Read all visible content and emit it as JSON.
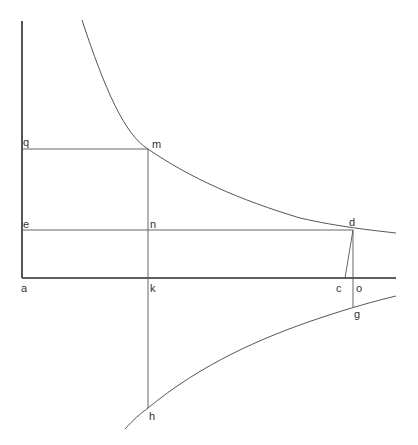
{
  "diagram": {
    "colors": {
      "axis": "#2a2a2a",
      "line": "#555555",
      "label": "#333333",
      "background": "#ffffff"
    },
    "axes": {
      "vertical": {
        "x1": 22,
        "y1": 21,
        "x2": 22,
        "y2": 278
      },
      "horizontal": {
        "x1": 22,
        "y1": 278,
        "x2": 396,
        "y2": 278
      }
    },
    "lines": [
      {
        "name": "line-qm",
        "x1": 22,
        "y1": 149,
        "x2": 148,
        "y2": 149
      },
      {
        "name": "line-en-d",
        "x1": 22,
        "y1": 230,
        "x2": 353,
        "y2": 230
      },
      {
        "name": "line-mk-h",
        "x1": 148,
        "y1": 149,
        "x2": 148,
        "y2": 408
      },
      {
        "name": "line-cd",
        "x1": 345,
        "y1": 278,
        "x2": 353,
        "y2": 230
      },
      {
        "name": "line-dog",
        "x1": 353,
        "y1": 230,
        "x2": 353,
        "y2": 307
      }
    ],
    "curves": [
      {
        "name": "upper-hyperbola",
        "d": "M 82 20 C 105 90, 125 135, 148 149 C 190 178, 240 200, 300 218 C 340 227, 370 230, 396 233"
      },
      {
        "name": "lower-curve",
        "d": "M 125 429 C 133 420, 140 414, 148 408 C 200 365, 260 338, 320 318 C 350 308, 375 301, 396 296"
      }
    ],
    "labels": [
      {
        "text": "q",
        "x": 23,
        "y": 146
      },
      {
        "text": "m",
        "x": 152,
        "y": 148
      },
      {
        "text": "e",
        "x": 23,
        "y": 228
      },
      {
        "text": "n",
        "x": 150,
        "y": 228
      },
      {
        "text": "d",
        "x": 349,
        "y": 226
      },
      {
        "text": "a",
        "x": 21,
        "y": 292
      },
      {
        "text": "k",
        "x": 150,
        "y": 292
      },
      {
        "text": "c",
        "x": 336,
        "y": 292
      },
      {
        "text": "o",
        "x": 356,
        "y": 292
      },
      {
        "text": "g",
        "x": 354,
        "y": 318
      },
      {
        "text": "h",
        "x": 149,
        "y": 420
      }
    ]
  }
}
